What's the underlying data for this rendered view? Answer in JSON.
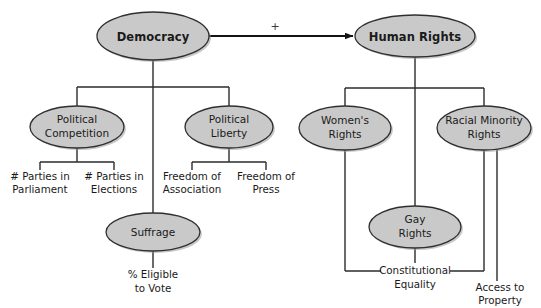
{
  "diagram": {
    "colors": {
      "node_fill": "#c9c9c9",
      "node_stroke": "#2f2f2f",
      "line": "#2b2b2b",
      "text": "#1a1a1a",
      "background": "#ffffff"
    },
    "relation_label": "+",
    "nodes": {
      "democracy": {
        "label": "Democracy",
        "line1": "Democracy",
        "line2": ""
      },
      "human_rights": {
        "label": "Human Rights",
        "line1": "Human Rights",
        "line2": ""
      },
      "political_competition": {
        "label": "Political Competition",
        "line1": "Political",
        "line2": "Competition"
      },
      "political_liberty": {
        "label": "Political Liberty",
        "line1": "Political",
        "line2": "Liberty"
      },
      "suffrage": {
        "label": "Suffrage",
        "line1": "Suffrage",
        "line2": ""
      },
      "womens_rights": {
        "label": "Women's Rights",
        "line1": "Women's",
        "line2": "Rights"
      },
      "racial_minority_rights": {
        "label": "Racial Minority Rights",
        "line1": "Racial Minority",
        "line2": "Rights"
      },
      "gay_rights": {
        "label": "Gay Rights",
        "line1": "Gay",
        "line2": "Rights"
      }
    },
    "indicators": {
      "parties_parliament": {
        "label": "# Parties in Parliament",
        "line1": "# Parties in",
        "line2": "Parliament"
      },
      "parties_elections": {
        "label": "# Parties in Elections",
        "line1": "# Parties in",
        "line2": "Elections"
      },
      "freedom_association": {
        "label": "Freedom of Association",
        "line1": "Freedom of",
        "line2": "Association"
      },
      "freedom_press": {
        "label": "Freedom of Press",
        "line1": "Freedom of",
        "line2": "Press"
      },
      "eligible_vote": {
        "label": "% Eligible to Vote",
        "line1": "% Eligible",
        "line2": "to Vote"
      },
      "constitutional_equality": {
        "label": "Constitutional Equality",
        "line1": "Constitutional",
        "line2": "Equality"
      },
      "access_property": {
        "label": "Access to Property",
        "line1": "Access to",
        "line2": "Property"
      }
    }
  }
}
